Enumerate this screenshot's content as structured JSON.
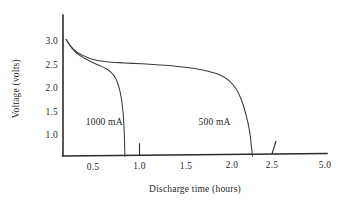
{
  "chart_data": {
    "type": "line",
    "title": "",
    "xlabel": "Discharge time (hours)",
    "ylabel": "Voltage (volts)",
    "xtick_labels": [
      "0.5",
      "1.0",
      "1.5",
      "2.0",
      "2.5",
      "5.0"
    ],
    "ytick_labels": [
      "3.0",
      "2.5",
      "2.0",
      "1.5",
      "1.0"
    ],
    "xlim": [
      0.17,
      5.0
    ],
    "ylim": [
      0.55,
      3.3
    ],
    "grid": false,
    "legend": "inline annotations on curves",
    "annotations": [
      {
        "text": "1000 mA",
        "x": 0.62,
        "y": 1.27
      },
      {
        "text": "500 mA",
        "x": 1.88,
        "y": 1.27
      }
    ],
    "series": [
      {
        "name": "1000 mA",
        "label": "1000 mA",
        "color": "#3a3a3a",
        "points": [
          [
            0.2,
            3.05
          ],
          [
            0.26,
            2.88
          ],
          [
            0.32,
            2.76
          ],
          [
            0.4,
            2.66
          ],
          [
            0.48,
            2.58
          ],
          [
            0.56,
            2.51
          ],
          [
            0.64,
            2.44
          ],
          [
            0.7,
            2.36
          ],
          [
            0.75,
            2.24
          ],
          [
            0.79,
            2.04
          ],
          [
            0.82,
            1.76
          ],
          [
            0.84,
            1.4
          ],
          [
            0.85,
            1.02
          ],
          [
            0.855,
            0.7
          ],
          [
            0.857,
            0.57
          ]
        ]
      },
      {
        "name": "500 mA",
        "label": "500 mA",
        "color": "#3a3a3a",
        "points": [
          [
            0.2,
            3.05
          ],
          [
            0.28,
            2.85
          ],
          [
            0.38,
            2.72
          ],
          [
            0.5,
            2.63
          ],
          [
            0.65,
            2.58
          ],
          [
            0.85,
            2.555
          ],
          [
            1.05,
            2.535
          ],
          [
            1.25,
            2.51
          ],
          [
            1.45,
            2.48
          ],
          [
            1.65,
            2.43
          ],
          [
            1.8,
            2.37
          ],
          [
            1.92,
            2.3
          ],
          [
            2.02,
            2.18
          ],
          [
            2.1,
            2.0
          ],
          [
            2.16,
            1.76
          ],
          [
            2.21,
            1.45
          ],
          [
            2.25,
            1.1
          ],
          [
            2.27,
            0.78
          ],
          [
            2.283,
            0.57
          ]
        ]
      }
    ]
  }
}
